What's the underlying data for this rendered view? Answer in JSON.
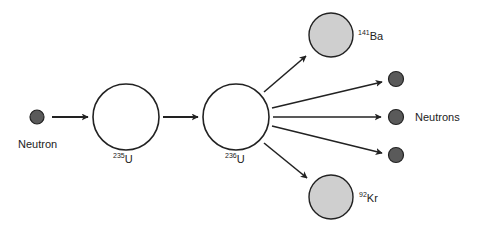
{
  "diagram": {
    "colors": {
      "stroke": "#222222",
      "neutron_fill": "#5a5a5a",
      "fragment_fill": "#cfcfcf",
      "nucleus_fill": "#ffffff"
    },
    "nodes": [
      {
        "id": "neutron-in",
        "label": "Neutron",
        "type": "neutron"
      },
      {
        "id": "u235",
        "label_mass": "235",
        "label_symbol": "U",
        "type": "nucleus"
      },
      {
        "id": "u236",
        "label_mass": "236",
        "label_symbol": "U",
        "type": "nucleus"
      },
      {
        "id": "ba141",
        "label_mass": "141",
        "label_symbol": "Ba",
        "type": "fragment"
      },
      {
        "id": "kr92",
        "label_mass": "92",
        "label_symbol": "Kr",
        "type": "fragment"
      },
      {
        "id": "neutrons-out",
        "label": "Neutrons",
        "type": "neutron",
        "count": 3
      }
    ],
    "edges": [
      {
        "from": "neutron-in",
        "to": "u235"
      },
      {
        "from": "u235",
        "to": "u236"
      },
      {
        "from": "u236",
        "to": "ba141"
      },
      {
        "from": "u236",
        "to": "neutrons-out"
      },
      {
        "from": "u236",
        "to": "neutrons-out"
      },
      {
        "from": "u236",
        "to": "neutrons-out"
      },
      {
        "from": "u236",
        "to": "kr92"
      }
    ]
  }
}
